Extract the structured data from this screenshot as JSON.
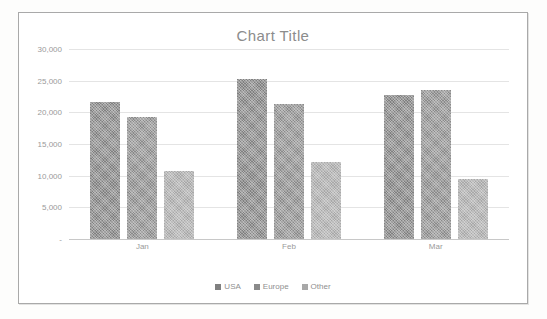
{
  "chart_data": {
    "type": "bar",
    "title": "Chart Title",
    "xlabel": "",
    "ylabel": "",
    "categories": [
      "Jan",
      "Feb",
      "Mar"
    ],
    "series": [
      {
        "name": "USA",
        "color": "#808080",
        "values": [
          21700,
          25300,
          22800
        ]
      },
      {
        "name": "Europe",
        "color": "#8a8a8a",
        "values": [
          19200,
          21300,
          23500
        ]
      },
      {
        "name": "Other",
        "color": "#a8a8a8",
        "values": [
          10800,
          12100,
          9500
        ]
      }
    ],
    "ylim": [
      0,
      30000
    ],
    "ytick_values": [
      30000,
      25000,
      20000,
      15000,
      10000,
      5000,
      0
    ],
    "ytick_labels": [
      "30,000",
      "25,000",
      "20,000",
      "15,000",
      "10,000",
      "5,000",
      "-"
    ],
    "grid": true,
    "legend_position": "bottom"
  },
  "style": {
    "border_color": "#a9a9a9",
    "gridline_color": "#e4e4e4",
    "title_color": "#8c8c8c",
    "tick_color": "#9a9a9a",
    "plot_background": "#ffffff"
  }
}
